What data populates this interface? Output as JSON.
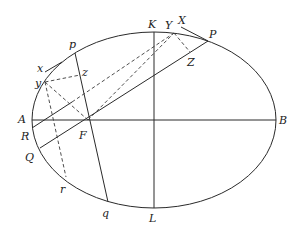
{
  "diagram": {
    "title": "",
    "type": "ellipse geometry construction",
    "ellipse": {
      "cx": 154,
      "cy": 120,
      "rx": 122,
      "ry": 88
    },
    "points": {
      "A": {
        "label": "A",
        "x": 32,
        "y": 120
      },
      "B": {
        "label": "B",
        "x": 276,
        "y": 120
      },
      "K": {
        "label": "K",
        "x": 154,
        "y": 32
      },
      "L": {
        "label": "L",
        "x": 154,
        "y": 208
      },
      "F": {
        "label": "F",
        "x": 88,
        "y": 120
      },
      "P": {
        "label": "P",
        "x": 208,
        "y": 41
      },
      "Q": {
        "label": "Q",
        "x": 40,
        "y": 148
      },
      "R": {
        "label": "R",
        "x": 32,
        "y": 128
      },
      "X": {
        "label": "X",
        "x": 181,
        "y": 27
      },
      "Y": {
        "label": "Y",
        "x": 174,
        "y": 33
      },
      "Z": {
        "label": "Z",
        "x": 190,
        "y": 52
      },
      "p": {
        "label": "p",
        "x": 75,
        "y": 53
      },
      "q": {
        "label": "q",
        "x": 108,
        "y": 202
      },
      "x": {
        "label": "x",
        "x": 45,
        "y": 72
      },
      "y": {
        "label": "y",
        "x": 45,
        "y": 82
      },
      "z": {
        "label": "z",
        "x": 80,
        "y": 75
      },
      "r": {
        "label": "r",
        "x": 66,
        "y": 177
      }
    },
    "labels": {
      "A": "A",
      "B": "B",
      "K": "K",
      "L": "L",
      "F": "F",
      "P": "P",
      "Q": "Q",
      "R": "R",
      "X": "X",
      "Y": "Y",
      "Z": "Z",
      "p": "p",
      "q": "q",
      "x": "x",
      "y": "y",
      "z": "z",
      "r": "r"
    },
    "solid_segments": [
      [
        "A",
        "B"
      ],
      [
        "K",
        "L"
      ],
      [
        "Q",
        "P"
      ],
      [
        "p",
        "q"
      ],
      [
        "X",
        "P"
      ],
      [
        "x",
        "y-tangent"
      ],
      [
        "R",
        "mid"
      ]
    ],
    "dashed_segments": [
      [
        "y",
        "z"
      ],
      [
        "y",
        "F"
      ],
      [
        "y",
        "r"
      ],
      [
        "y",
        "Y"
      ],
      [
        "F",
        "Y"
      ],
      [
        "Y",
        "Z"
      ],
      [
        "R-line",
        "Y"
      ]
    ]
  }
}
